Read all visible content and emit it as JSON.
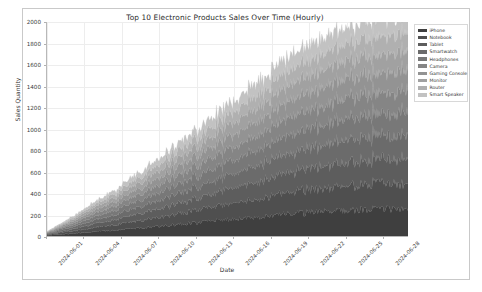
{
  "chart_data": {
    "type": "area",
    "stacked": true,
    "title": "Top 10 Electronic Products Sales Over Time (Hourly)",
    "xlabel": "Date",
    "ylabel": "Sales Quantity",
    "ylim": [
      0,
      2000
    ],
    "yticks": [
      0,
      200,
      400,
      600,
      800,
      1000,
      1200,
      1400,
      1600,
      1800,
      2000
    ],
    "xticks": [
      "2024-06-01",
      "2024-06-04",
      "2024-06-07",
      "2024-06-10",
      "2024-06-13",
      "2024-06-16",
      "2024-06-19",
      "2024-06-22",
      "2024-06-25",
      "2024-06-28"
    ],
    "x_range": [
      "2024-06-01",
      "2024-06-30"
    ],
    "grid": true,
    "legend_position": "upper right",
    "noise": "hourly high-frequency fluctuation on every band",
    "trend": "each series grows roughly linearly from near 0 at 2024-06-01 to its maximum at 2024-06-30; stacked total reaches about 1900-2000",
    "series": [
      {
        "name": "iPhone",
        "color": "#3f3f3f",
        "start_value": 6,
        "end_value": 250,
        "values": [
          6,
          14,
          22,
          31,
          40,
          49,
          58,
          68,
          78,
          88,
          99,
          110,
          121,
          132,
          143,
          154,
          165,
          176,
          187,
          198,
          206,
          214,
          221,
          228,
          233,
          238,
          242,
          245,
          248,
          250
        ]
      },
      {
        "name": "Notebook",
        "color": "#4f4f4f",
        "start_value": 5,
        "end_value": 235,
        "values": [
          5,
          13,
          21,
          29,
          38,
          46,
          55,
          64,
          73,
          83,
          93,
          103,
          113,
          124,
          134,
          145,
          155,
          165,
          175,
          185,
          194,
          202,
          209,
          215,
          220,
          224,
          228,
          231,
          233,
          235
        ]
      },
      {
        "name": "Tablet",
        "color": "#5d5d5d",
        "start_value": 5,
        "end_value": 225,
        "values": [
          5,
          12,
          20,
          28,
          36,
          44,
          53,
          61,
          70,
          79,
          89,
          98,
          108,
          118,
          128,
          138,
          148,
          158,
          167,
          176,
          185,
          193,
          200,
          206,
          211,
          215,
          219,
          221,
          223,
          225
        ]
      },
      {
        "name": "Smartwatch",
        "color": "#6b6b6b",
        "start_value": 4,
        "end_value": 215,
        "values": [
          4,
          11,
          18,
          26,
          34,
          42,
          50,
          58,
          67,
          76,
          85,
          94,
          103,
          113,
          122,
          132,
          141,
          151,
          160,
          169,
          177,
          185,
          192,
          198,
          203,
          207,
          210,
          212,
          214,
          215
        ]
      },
      {
        "name": "Headphones",
        "color": "#787878",
        "start_value": 4,
        "end_value": 205,
        "values": [
          4,
          11,
          18,
          25,
          32,
          40,
          48,
          56,
          64,
          72,
          81,
          90,
          99,
          108,
          117,
          126,
          135,
          144,
          153,
          161,
          169,
          176,
          183,
          189,
          194,
          198,
          201,
          203,
          204,
          205
        ]
      },
      {
        "name": "Camera",
        "color": "#858585",
        "start_value": 4,
        "end_value": 196,
        "values": [
          4,
          10,
          17,
          24,
          31,
          38,
          46,
          53,
          61,
          69,
          77,
          86,
          94,
          103,
          111,
          120,
          129,
          137,
          146,
          154,
          161,
          168,
          175,
          180,
          185,
          189,
          192,
          194,
          195,
          196
        ]
      },
      {
        "name": "Gaming Console",
        "color": "#939393",
        "start_value": 3,
        "end_value": 186,
        "values": [
          3,
          9,
          16,
          22,
          29,
          36,
          43,
          50,
          58,
          65,
          73,
          81,
          89,
          97,
          105,
          114,
          122,
          130,
          138,
          146,
          153,
          160,
          166,
          171,
          176,
          180,
          182,
          184,
          185,
          186
        ]
      },
      {
        "name": "Monitor",
        "color": "#a1a1a1",
        "start_value": 3,
        "end_value": 176,
        "values": [
          3,
          9,
          15,
          21,
          27,
          34,
          41,
          48,
          55,
          62,
          69,
          77,
          84,
          92,
          100,
          108,
          116,
          124,
          131,
          139,
          145,
          151,
          157,
          162,
          166,
          170,
          172,
          174,
          175,
          176
        ]
      },
      {
        "name": "Router",
        "color": "#b0b0b0",
        "start_value": 3,
        "end_value": 166,
        "values": [
          3,
          8,
          14,
          20,
          26,
          32,
          39,
          45,
          52,
          59,
          66,
          73,
          80,
          87,
          94,
          102,
          109,
          117,
          124,
          131,
          137,
          143,
          148,
          153,
          157,
          160,
          163,
          164,
          165,
          166
        ]
      },
      {
        "name": "Smart Speaker",
        "color": "#c2c2c2",
        "start_value": 2,
        "end_value": 156,
        "values": [
          2,
          7,
          13,
          18,
          24,
          30,
          36,
          42,
          49,
          55,
          62,
          69,
          75,
          82,
          89,
          96,
          103,
          110,
          117,
          123,
          129,
          135,
          140,
          144,
          148,
          151,
          153,
          154,
          155,
          156
        ]
      }
    ]
  }
}
